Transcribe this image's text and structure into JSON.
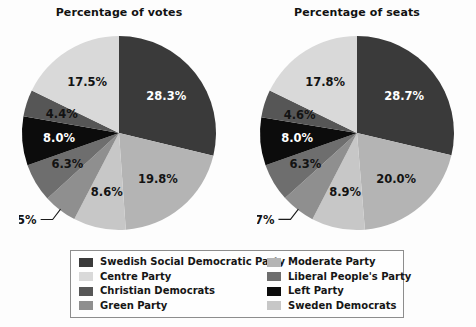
{
  "charts": [
    {
      "title": "Percentage of votes",
      "labels": [
        "28.3%",
        "19.8%",
        "8.6%",
        "5.5%",
        "6.3%",
        "8.0%",
        "4.4%",
        "17.5%"
      ]
    },
    {
      "title": "Percentage of seats",
      "labels": [
        "28.7%",
        "20.0%",
        "8.9%",
        "5.7%",
        "6.3%",
        "8.0%",
        "4.6%",
        "17.8%"
      ]
    }
  ],
  "legend": {
    "column_left": [
      {
        "label": "Swedish Social Democratic Party",
        "color": "#3a3a3a"
      },
      {
        "label": "Centre Party",
        "color": "#d9d9d9"
      },
      {
        "label": "Christian Democrats",
        "color": "#565656"
      },
      {
        "label": "Green Party",
        "color": "#8f8f8f"
      }
    ],
    "column_right": [
      {
        "label": "Moderate Party",
        "color": "#b4b4b4"
      },
      {
        "label": "Liberal People's Party",
        "color": "#6e6e6e"
      },
      {
        "label": "Left Party",
        "color": "#0c0c0c"
      },
      {
        "label": "Sweden Democrats",
        "color": "#c7c7c7"
      }
    ]
  },
  "chart_data": [
    {
      "type": "pie",
      "title": "Percentage of votes",
      "categories": [
        "Swedish Social Democratic Party",
        "Moderate Party",
        "Sweden Democrats",
        "Green Party",
        "Liberal People's Party",
        "Left Party",
        "Christian Democrats",
        "Centre Party"
      ],
      "values": [
        28.3,
        19.8,
        8.6,
        5.5,
        6.3,
        8.0,
        4.4,
        17.5
      ],
      "labels": [
        "28.3%",
        "19.8%",
        "8.6%",
        "5.5%",
        "6.3%",
        "8.0%",
        "4.4%",
        "17.5%"
      ],
      "colors": [
        "#3a3a3a",
        "#b4b4b4",
        "#c7c7c7",
        "#8f8f8f",
        "#6e6e6e",
        "#0c0c0c",
        "#565656",
        "#d9d9d9"
      ],
      "label_colors": [
        "light",
        "dark",
        "dark",
        "dark",
        "dark",
        "light",
        "dark",
        "dark"
      ],
      "external_labels": [
        "5.5%"
      ],
      "start_angle": 0,
      "direction": "clockwise",
      "legend_position": "bottom",
      "grid": false,
      "ylabel": "",
      "xlabel": ""
    },
    {
      "type": "pie",
      "title": "Percentage of seats",
      "categories": [
        "Swedish Social Democratic Party",
        "Moderate Party",
        "Sweden Democrats",
        "Green Party",
        "Liberal People's Party",
        "Left Party",
        "Christian Democrats",
        "Centre Party"
      ],
      "values": [
        28.7,
        20.0,
        8.9,
        5.7,
        6.3,
        8.0,
        4.6,
        17.8
      ],
      "labels": [
        "28.7%",
        "20.0%",
        "8.9%",
        "5.7%",
        "6.3%",
        "8.0%",
        "4.6%",
        "17.8%"
      ],
      "colors": [
        "#3a3a3a",
        "#b4b4b4",
        "#c7c7c7",
        "#8f8f8f",
        "#6e6e6e",
        "#0c0c0c",
        "#565656",
        "#d9d9d9"
      ],
      "label_colors": [
        "light",
        "dark",
        "dark",
        "dark",
        "dark",
        "light",
        "dark",
        "dark"
      ],
      "external_labels": [
        "5.7%"
      ],
      "start_angle": 0,
      "direction": "clockwise",
      "legend_position": "bottom",
      "grid": false,
      "ylabel": "",
      "xlabel": ""
    }
  ]
}
